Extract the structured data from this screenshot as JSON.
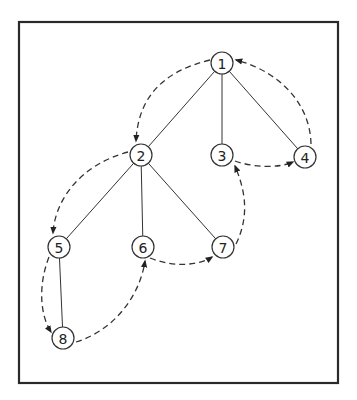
{
  "diagram": {
    "type": "tree-traversal",
    "frame": {
      "x": 19,
      "y": 22,
      "width": 319,
      "height": 361
    },
    "nodes": [
      {
        "id": "1",
        "label": "1",
        "x": 222,
        "y": 63
      },
      {
        "id": "2",
        "label": "2",
        "x": 141,
        "y": 155
      },
      {
        "id": "3",
        "label": "3",
        "x": 222,
        "y": 155
      },
      {
        "id": "4",
        "label": "4",
        "x": 305,
        "y": 157
      },
      {
        "id": "5",
        "label": "5",
        "x": 59,
        "y": 247
      },
      {
        "id": "6",
        "label": "6",
        "x": 143,
        "y": 247
      },
      {
        "id": "7",
        "label": "7",
        "x": 223,
        "y": 247
      },
      {
        "id": "8",
        "label": "8",
        "x": 63,
        "y": 338
      }
    ],
    "tree_edges": [
      [
        "1",
        "2"
      ],
      [
        "1",
        "3"
      ],
      [
        "1",
        "4"
      ],
      [
        "2",
        "5"
      ],
      [
        "2",
        "6"
      ],
      [
        "2",
        "7"
      ],
      [
        "5",
        "8"
      ]
    ],
    "traversal_edges": [
      {
        "from": "1",
        "to": "2",
        "path": "M 210 60 C 160 72, 138 100, 136 141"
      },
      {
        "from": "2",
        "to": "5",
        "path": "M 128 152 C 80 165, 55 200, 53 233"
      },
      {
        "from": "5",
        "to": "8",
        "path": "M 49 257 C 38 285, 40 315, 51 332"
      },
      {
        "from": "8",
        "to": "6",
        "path": "M 76 342 C 115 330, 140 295, 145 261"
      },
      {
        "from": "6",
        "to": "7",
        "path": "M 150 258 C 175 268, 200 265, 212 257"
      },
      {
        "from": "7",
        "to": "3",
        "path": "M 236 244 C 250 215, 245 190, 235 166"
      },
      {
        "from": "3",
        "to": "4",
        "path": "M 235 161 C 255 168, 280 168, 293 162"
      },
      {
        "from": "4",
        "to": "1",
        "path": "M 311 144 C 310 100, 275 70, 236 60"
      }
    ],
    "node_radius": 11,
    "stroke_color": "#333333",
    "background": "#ffffff"
  }
}
